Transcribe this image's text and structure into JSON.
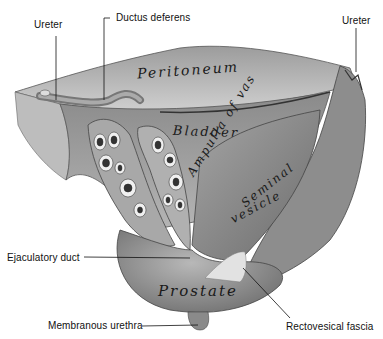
{
  "figure": {
    "type": "anatomical-illustration",
    "external_labels": [
      {
        "id": "ureter-left",
        "text": "Ureter"
      },
      {
        "id": "ductus-deferens",
        "text": "Ductus deferens"
      },
      {
        "id": "ureter-right",
        "text": "Ureter"
      },
      {
        "id": "ejaculatory-duct",
        "text": "Ejaculatory duct"
      },
      {
        "id": "membranous-urethra",
        "text": "Membranous urethra"
      },
      {
        "id": "rectovesical-fascia",
        "text": "Rectovesical fascia"
      }
    ],
    "structure_labels": [
      {
        "id": "peritoneum",
        "text": "Peritoneum"
      },
      {
        "id": "bladder",
        "text": "Bladder"
      },
      {
        "id": "ampulla",
        "text": "Ampulla of vas"
      },
      {
        "id": "seminal",
        "text": "Seminal"
      },
      {
        "id": "vesicle",
        "text": "vesicle"
      },
      {
        "id": "prostate",
        "text": "Prostate"
      }
    ]
  }
}
